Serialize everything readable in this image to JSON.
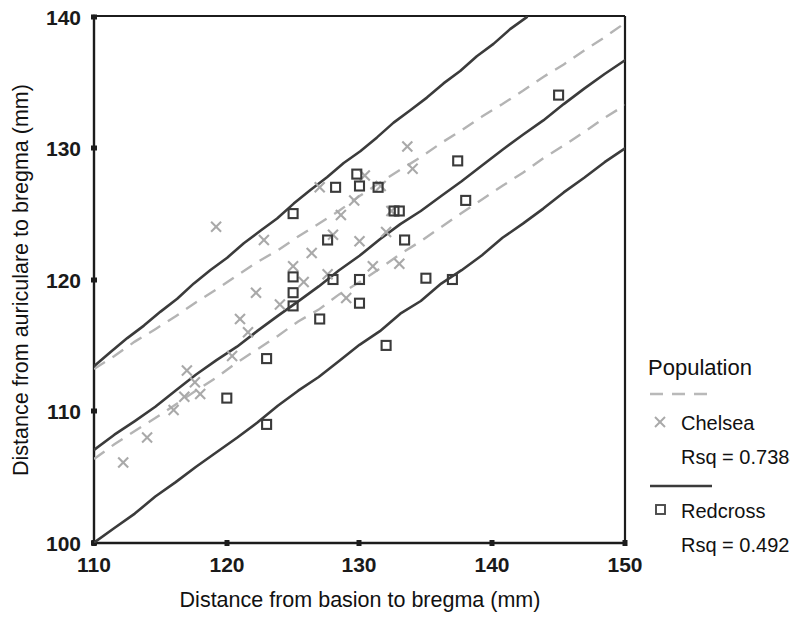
{
  "chart_data": {
    "type": "scatter",
    "title": "",
    "xlabel": "Distance from basion to bregma (mm)",
    "ylabel": "Distance from auriculare to bregma (mm)",
    "xlim": [
      110,
      150
    ],
    "ylim": [
      100,
      140
    ],
    "xticks": [
      110,
      120,
      130,
      140,
      150
    ],
    "yticks": [
      100,
      110,
      120,
      130,
      140
    ],
    "xtick_labels": [
      "110",
      "120",
      "130",
      "140",
      "150"
    ],
    "ytick_labels": [
      "100",
      "110",
      "120",
      "130",
      "140"
    ],
    "grid": false,
    "legend_position": "right",
    "legend_title": "Population",
    "series": [
      {
        "name": "Chelsea",
        "marker": "x",
        "marker_color": "#a9a9a9",
        "line_style": "dashed",
        "line_color": "#b4b4b4",
        "rsq_label": "Rsq = 0.7384",
        "rsq": 0.7384,
        "points": [
          {
            "x": 112.2,
            "y": 106.1
          },
          {
            "x": 114.0,
            "y": 108.0
          },
          {
            "x": 116.0,
            "y": 110.1
          },
          {
            "x": 116.8,
            "y": 111.1
          },
          {
            "x": 117.0,
            "y": 113.1
          },
          {
            "x": 117.6,
            "y": 112.2
          },
          {
            "x": 118.0,
            "y": 111.3
          },
          {
            "x": 119.2,
            "y": 124.0
          },
          {
            "x": 120.4,
            "y": 114.2
          },
          {
            "x": 121.0,
            "y": 117.0
          },
          {
            "x": 121.6,
            "y": 116.0
          },
          {
            "x": 122.2,
            "y": 119.0
          },
          {
            "x": 122.8,
            "y": 123.0
          },
          {
            "x": 124.0,
            "y": 118.1
          },
          {
            "x": 125.0,
            "y": 121.0
          },
          {
            "x": 125.8,
            "y": 119.8
          },
          {
            "x": 126.4,
            "y": 122.0
          },
          {
            "x": 127.0,
            "y": 127.0
          },
          {
            "x": 127.6,
            "y": 120.4
          },
          {
            "x": 128.0,
            "y": 123.4
          },
          {
            "x": 128.6,
            "y": 124.9
          },
          {
            "x": 129.0,
            "y": 118.6
          },
          {
            "x": 129.6,
            "y": 126.0
          },
          {
            "x": 130.0,
            "y": 122.9
          },
          {
            "x": 130.4,
            "y": 127.9
          },
          {
            "x": 131.0,
            "y": 121.0
          },
          {
            "x": 131.6,
            "y": 127.1
          },
          {
            "x": 132.0,
            "y": 123.6
          },
          {
            "x": 132.4,
            "y": 125.2
          },
          {
            "x": 133.0,
            "y": 121.2
          },
          {
            "x": 133.6,
            "y": 130.1
          },
          {
            "x": 134.0,
            "y": 128.4
          }
        ],
        "fit_line": [
          {
            "x": 110,
            "y": 113.2
          },
          {
            "x": 150,
            "y": 139.4
          }
        ],
        "fit_line_lower": [
          {
            "x": 110,
            "y": 106.4
          },
          {
            "x": 150,
            "y": 133.3
          }
        ]
      },
      {
        "name": "Redcross",
        "marker": "square",
        "marker_color": "#3a3a3a",
        "line_style": "solid",
        "line_color": "#3b3b3b",
        "rsq_label": "Rsq = 0.4928",
        "rsq": 0.4928,
        "points": [
          {
            "x": 120.0,
            "y": 111.0
          },
          {
            "x": 123.0,
            "y": 109.0
          },
          {
            "x": 123.0,
            "y": 114.0
          },
          {
            "x": 125.0,
            "y": 125.0
          },
          {
            "x": 125.0,
            "y": 120.2
          },
          {
            "x": 125.0,
            "y": 119.0
          },
          {
            "x": 125.0,
            "y": 118.0
          },
          {
            "x": 127.0,
            "y": 117.0
          },
          {
            "x": 127.6,
            "y": 123.0
          },
          {
            "x": 128.0,
            "y": 120.0
          },
          {
            "x": 128.2,
            "y": 127.0
          },
          {
            "x": 129.8,
            "y": 128.0
          },
          {
            "x": 130.0,
            "y": 127.1
          },
          {
            "x": 130.0,
            "y": 120.0
          },
          {
            "x": 130.0,
            "y": 118.2
          },
          {
            "x": 131.4,
            "y": 127.0
          },
          {
            "x": 132.0,
            "y": 115.0
          },
          {
            "x": 132.6,
            "y": 125.2
          },
          {
            "x": 133.0,
            "y": 125.2
          },
          {
            "x": 133.4,
            "y": 123.0
          },
          {
            "x": 135.0,
            "y": 120.1
          },
          {
            "x": 137.0,
            "y": 120.0
          },
          {
            "x": 137.4,
            "y": 129.0
          },
          {
            "x": 138.0,
            "y": 126.0
          },
          {
            "x": 145.0,
            "y": 134.0
          }
        ],
        "fit_line": [
          {
            "x": 110,
            "y": 107.0
          },
          {
            "x": 150,
            "y": 136.7
          }
        ],
        "fit_line_lower": [
          {
            "x": 110,
            "y": 100.0
          },
          {
            "x": 150,
            "y": 130.0
          }
        ],
        "fit_line_upper": [
          {
            "x": 110,
            "y": 113.5
          },
          {
            "x": 142.6,
            "y": 140.0
          }
        ]
      }
    ]
  },
  "legend": {
    "title": "Population",
    "entries": [
      {
        "label": "Chelsea",
        "rsq": "Rsq = 0.7384",
        "marker": "cross-marker",
        "line": "dashed-line"
      },
      {
        "label": "Redcross",
        "rsq": "Rsq = 0.4928",
        "marker": "square-marker",
        "line": "solid-line"
      }
    ]
  },
  "axes": {
    "x_title": "Distance from basion to bregma (mm)",
    "y_title": "Distance from auriculare to bregma (mm)",
    "x_ticks": [
      "110",
      "120",
      "130",
      "140",
      "150"
    ],
    "y_ticks": [
      "100",
      "110",
      "120",
      "130",
      "140"
    ]
  }
}
